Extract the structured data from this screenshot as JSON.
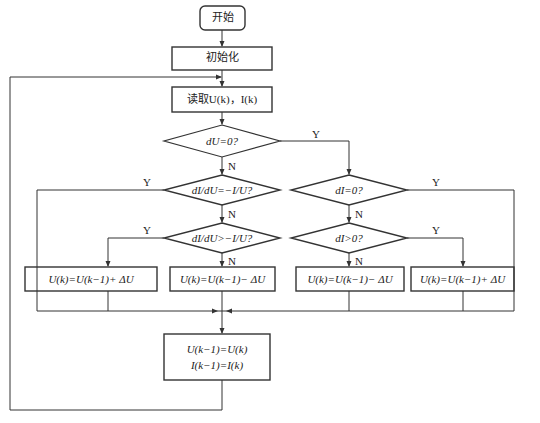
{
  "diagram": {
    "type": "flowchart",
    "nodes": {
      "start": {
        "label": "开始"
      },
      "init": {
        "label": "初始化"
      },
      "read": {
        "label": "读取U(k)，I(k)"
      },
      "dec_du0": {
        "label": "dU=0?"
      },
      "dec_eq": {
        "label": "dI/dU=−I/U?"
      },
      "dec_gt": {
        "label": "dI/dU>−I/U?"
      },
      "dec_di0": {
        "label": "dI=0?"
      },
      "dec_digt0": {
        "label": "dI>0?"
      },
      "inc_left": {
        "label": "U(k)=U(k−1)+ ΔU"
      },
      "dec_left": {
        "label": "U(k)=U(k−1)− ΔU"
      },
      "dec_right": {
        "label": "U(k)=U(k−1)− ΔU"
      },
      "inc_right": {
        "label": "U(k)=U(k−1)+ ΔU"
      },
      "update_line1": {
        "label": "U(k−1)=U(k)"
      },
      "update_line2": {
        "label": "I(k−1)=I(k)"
      }
    },
    "branch_labels": {
      "yes": "Y",
      "no": "N"
    },
    "edges": [
      {
        "from": "start",
        "to": "init"
      },
      {
        "from": "init",
        "to": "read"
      },
      {
        "from": "read",
        "to": "dec_du0"
      },
      {
        "from": "dec_du0",
        "to": "dec_eq",
        "label": "N"
      },
      {
        "from": "dec_du0",
        "to": "dec_di0",
        "label": "Y"
      },
      {
        "from": "dec_eq",
        "to": "update",
        "label": "Y"
      },
      {
        "from": "dec_eq",
        "to": "dec_gt",
        "label": "N"
      },
      {
        "from": "dec_gt",
        "to": "inc_left",
        "label": "Y"
      },
      {
        "from": "dec_gt",
        "to": "dec_left",
        "label": "N"
      },
      {
        "from": "dec_di0",
        "to": "update",
        "label": "Y"
      },
      {
        "from": "dec_di0",
        "to": "dec_digt0",
        "label": "N"
      },
      {
        "from": "dec_digt0",
        "to": "inc_right",
        "label": "Y"
      },
      {
        "from": "dec_digt0",
        "to": "dec_right",
        "label": "N"
      },
      {
        "from": "inc_left",
        "to": "update"
      },
      {
        "from": "dec_left",
        "to": "update"
      },
      {
        "from": "dec_right",
        "to": "update"
      },
      {
        "from": "inc_right",
        "to": "update"
      },
      {
        "from": "update",
        "to": "read"
      }
    ]
  }
}
